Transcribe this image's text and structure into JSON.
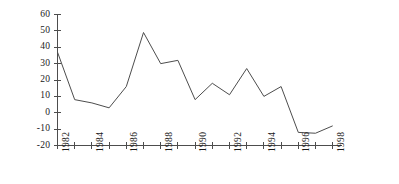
{
  "chart_data": {
    "type": "line",
    "title": "",
    "subtitle": "",
    "xlabel": "",
    "ylabel": "",
    "x": [
      1982,
      1983,
      1984,
      1985,
      1986,
      1987,
      1988,
      1989,
      1990,
      1991,
      1992,
      1993,
      1994,
      1995,
      1996,
      1997,
      1998
    ],
    "values": [
      37,
      8,
      6,
      3,
      16,
      49,
      30,
      32,
      8,
      18,
      11,
      27,
      10,
      16,
      -12,
      -12.5,
      -8
    ],
    "series": [
      {
        "name": "series-1",
        "values": [
          37,
          8,
          6,
          3,
          16,
          49,
          30,
          32,
          8,
          18,
          11,
          27,
          10,
          16,
          -12,
          -12.5,
          -8
        ]
      }
    ],
    "categories": [
      "1982",
      "1983",
      "1984",
      "1985",
      "1986",
      "1987",
      "1988",
      "1989",
      "1990",
      "1991",
      "1992",
      "1993",
      "1994",
      "1995",
      "1996",
      "1997",
      "1998"
    ],
    "xlim": [
      1982,
      1998
    ],
    "ylim": [
      -20,
      60
    ],
    "y_ticks": [
      60,
      50,
      40,
      30,
      20,
      10,
      0,
      -10,
      -20
    ],
    "y_tick_labels": [
      "60",
      "50",
      "40",
      "30",
      "20",
      "10",
      "0",
      "-10",
      "-20"
    ],
    "x_ticks": [
      1982,
      1983,
      1984,
      1985,
      1986,
      1987,
      1988,
      1989,
      1990,
      1991,
      1992,
      1993,
      1994,
      1995,
      1996,
      1997,
      1998
    ],
    "x_tick_labels": [
      "1982",
      "",
      "1984",
      "",
      "1986",
      "",
      "1988",
      "",
      "1990",
      "",
      "1992",
      "",
      "1994",
      "",
      "1996",
      "",
      "1998"
    ],
    "x_tick_labels_visible": [
      "1982",
      "1984",
      "1986",
      "1988",
      "1990",
      "1992",
      "1994",
      "1996",
      "1998"
    ],
    "grid": false,
    "legend": null,
    "legend_position": "none",
    "line_color": "#4d4d4d",
    "axis_color": "#4d4d4d",
    "background_color": "#ffffff",
    "annotations": []
  }
}
